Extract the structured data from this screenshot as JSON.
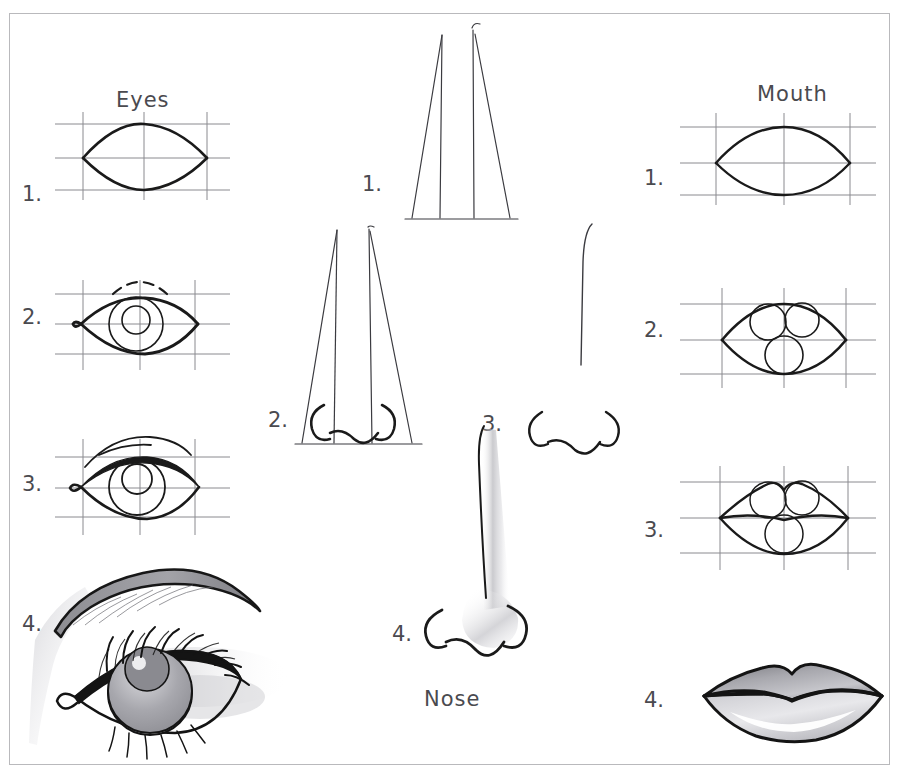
{
  "page": {
    "background_color": "#ffffff",
    "border_color": "#b9b9bc",
    "ink_color": "#1a1a1a",
    "guide_color": "#8a8a8f",
    "shade_color": "#9a9a9e"
  },
  "columns": {
    "eyes": {
      "label": "Eyes",
      "label_position": "top",
      "steps": [
        {
          "number": "1.",
          "description": "almond outline inside guide grid"
        },
        {
          "number": "2.",
          "description": "iris circle, pupil and dashed upper lid crease added"
        },
        {
          "number": "3.",
          "description": "lid thickness, tear duct and brow line refined"
        },
        {
          "number": "4.",
          "description": "finished shaded eye with eyebrow and eyelashes"
        }
      ]
    },
    "nose": {
      "label": "Nose",
      "label_position": "bottom",
      "steps": [
        {
          "number": "1.",
          "description": "tall narrow trapezoid with two vertical centre lines"
        },
        {
          "number": "2.",
          "description": "nostril wings and base curve drawn at the bottom"
        },
        {
          "number": "3.",
          "description": "nostrils and tip curve isolated from the guide shape"
        },
        {
          "number": "4.",
          "description": "finished shaded nose with bridge shading"
        }
      ]
    },
    "mouth": {
      "label": "Mouth",
      "label_position": "top",
      "steps": [
        {
          "number": "1.",
          "description": "almond outline inside guide grid"
        },
        {
          "number": "2.",
          "description": "three circles placed for upper lip lobes and lower lip"
        },
        {
          "number": "3.",
          "description": "cupid's bow and lip contours traced over the circles"
        },
        {
          "number": "4.",
          "description": "finished shaded lips with highlight"
        }
      ]
    }
  }
}
